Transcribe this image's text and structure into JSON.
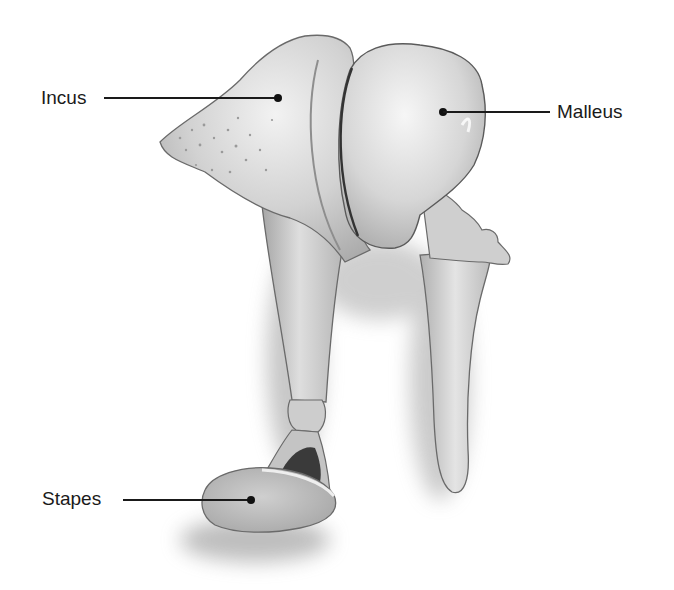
{
  "figure": {
    "background": "#ffffff",
    "bone_color": "#d4d4d4",
    "outline_color": "#6a6a6a",
    "leader_color": "#1a1a1a"
  },
  "labels": [
    {
      "id": "incus",
      "text": "Incus",
      "side": "left"
    },
    {
      "id": "malleus",
      "text": "Malleus",
      "side": "right"
    },
    {
      "id": "stapes",
      "text": "Stapes",
      "side": "left"
    }
  ]
}
